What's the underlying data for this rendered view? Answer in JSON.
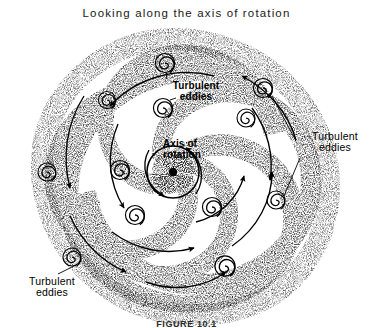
{
  "figure": {
    "title": "Looking along the axis of rotation",
    "caption": "FIGURE 10.1",
    "background_color": "#ffffff",
    "ink_color": "#000000",
    "stipple_color": "#3a3a3a"
  },
  "labels": {
    "eddies_top": {
      "line1": "Turbulent",
      "line2": "eddies"
    },
    "eddies_right": {
      "line1": "Turbulent",
      "line2": "eddies"
    },
    "eddies_bottom_left": {
      "line1": "Turbulent",
      "line2": "eddies"
    },
    "axis": {
      "line1": "Axis of",
      "line2": "rotation"
    }
  },
  "diagram": {
    "type": "stippled-spiral-vortex",
    "center": {
      "x": 173,
      "y": 172
    },
    "hub_dot_radius": 4.2,
    "hub_ring_radius": 26,
    "arm_count": 5,
    "arm_turns": 1.55,
    "outer_radius": 150,
    "rotation_sense": "counterclockwise",
    "eddy_glyph": {
      "shape": "spiral",
      "turns": 2.5,
      "radius": 8.5
    },
    "eddies": [
      {
        "id": 1,
        "x": 165,
        "y": 63,
        "r": 9.0
      },
      {
        "id": 2,
        "x": 107,
        "y": 100,
        "r": 8.0
      },
      {
        "id": 3,
        "x": 163,
        "y": 108,
        "r": 9.0
      },
      {
        "id": 4,
        "x": 263,
        "y": 88,
        "r": 9.0
      },
      {
        "id": 5,
        "x": 246,
        "y": 118,
        "r": 8.5
      },
      {
        "id": 6,
        "x": 47,
        "y": 172,
        "r": 8.5
      },
      {
        "id": 7,
        "x": 120,
        "y": 170,
        "r": 9.0
      },
      {
        "id": 8,
        "x": 276,
        "y": 200,
        "r": 8.5
      },
      {
        "id": 9,
        "x": 135,
        "y": 215,
        "r": 9.0
      },
      {
        "id": 10,
        "x": 212,
        "y": 207,
        "r": 9.0
      },
      {
        "id": 11,
        "x": 72,
        "y": 257,
        "r": 8.5
      },
      {
        "id": 12,
        "x": 225,
        "y": 266,
        "r": 9.5
      }
    ],
    "leader_lines": [
      {
        "from_label": "eddies_top",
        "to_eddy": 1
      },
      {
        "from_label": "eddies_top",
        "to_eddy": 3
      },
      {
        "from_label": "eddies_right",
        "to_eddy": 4
      },
      {
        "from_label": "eddies_right",
        "to_eddy": 8
      },
      {
        "from_label": "eddies_bottom_left",
        "to_eddy": 11
      }
    ],
    "flow_arrow_count": 12
  }
}
